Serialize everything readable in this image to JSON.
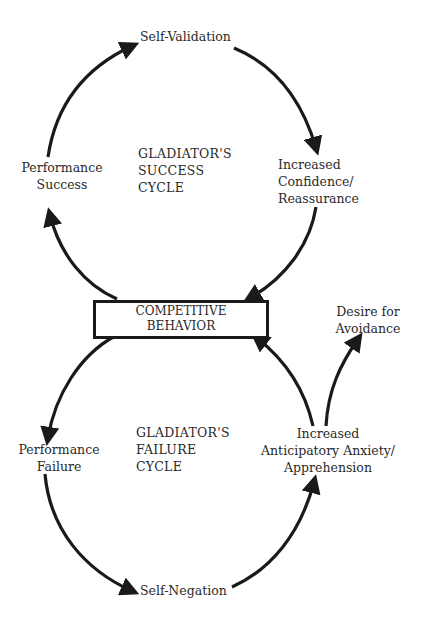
{
  "diagram": {
    "center_node": {
      "line1": "COMPETITIVE",
      "line2": "BEHAVIOR"
    },
    "success_cycle": {
      "title": {
        "line1": "GLADIATOR'S",
        "line2": "SUCCESS",
        "line3": "CYCLE"
      },
      "nodes": {
        "self_validation": "Self-Validation",
        "increased_confidence": {
          "line1": "Increased",
          "line2": "Confidence/",
          "line3": "Reassurance"
        },
        "performance_success": {
          "line1": "Performance",
          "line2": "Success"
        }
      }
    },
    "failure_cycle": {
      "title": {
        "line1": "GLADIATOR'S",
        "line2": "FAILURE",
        "line3": "CYCLE"
      },
      "nodes": {
        "performance_failure": {
          "line1": "Performance",
          "line2": "Failure"
        },
        "self_negation": "Self-Negation",
        "anticipatory_anxiety": {
          "line1": "Increased",
          "line2": "Anticipatory Anxiety/",
          "line3": "Apprehension"
        }
      }
    },
    "side_node": {
      "line1": "Desire for",
      "line2": "Avoidance"
    },
    "colors": {
      "stroke": "#1a1a1a",
      "text": "#2a2a2a",
      "background": "#ffffff"
    }
  }
}
